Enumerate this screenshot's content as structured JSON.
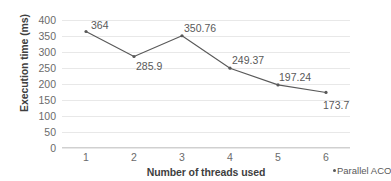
{
  "chart_data": {
    "type": "line",
    "title": "",
    "xlabel": "Number of threads used",
    "ylabel": "Execution time (ms)",
    "categories": [
      "1",
      "2",
      "3",
      "4",
      "5",
      "6"
    ],
    "x": [
      1,
      2,
      3,
      4,
      5,
      6
    ],
    "series": [
      {
        "name": "Parallel ACO",
        "values": [
          364,
          285.9,
          350.76,
          249.37,
          197.24,
          173.7
        ],
        "color": "#595959",
        "marker": "dot"
      }
    ],
    "data_labels": [
      "364",
      "285.9",
      "350.76",
      "249.37",
      "197.24",
      "173.7"
    ],
    "ylim": [
      0,
      400
    ],
    "ytick_labels": [
      "400",
      "350",
      "300",
      "250",
      "200",
      "150",
      "100",
      "50",
      "0"
    ],
    "ytick_values": [
      400,
      350,
      300,
      250,
      200,
      150,
      100,
      50,
      0
    ],
    "grid": "horizontal",
    "grid_color": "#e8e8e8",
    "legend_position": "bottom-right",
    "legend": [
      {
        "label": "Parallel ACO",
        "marker_color": "#595959"
      }
    ],
    "axis_color": "#d0d0d0",
    "tick_label_color": "#6b6b6b",
    "axis_title_color": "#3f3f3f"
  }
}
